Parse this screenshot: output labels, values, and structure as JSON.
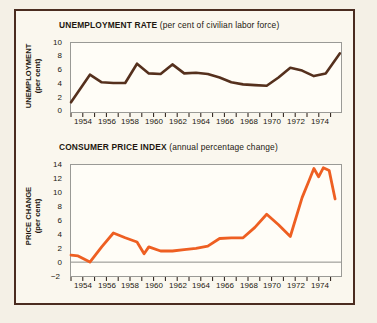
{
  "figure": {
    "background_color": "#f4f0e6",
    "border_color": "#4a2c20"
  },
  "charts": [
    {
      "id": "unemployment",
      "title_main": "UNEMPLOYMENT RATE",
      "title_sub": "(per cent of civilian labor force)",
      "ylabel_line1": "UNEMPLOYMENT",
      "ylabel_line2": "(per cent)",
      "line_color": "#55301d",
      "yticks": [
        "10",
        "8",
        "6",
        "4",
        "2",
        "0"
      ],
      "xticks": [
        "1954",
        "1956",
        "1958",
        "1960",
        "1962",
        "1964",
        "1966",
        "1968",
        "1970",
        "1972",
        "1974"
      ]
    },
    {
      "id": "cpi",
      "title_main": "CONSUMER PRICE INDEX",
      "title_sub": "(annual percentage change)",
      "ylabel_line1": "PRICE CHANGE",
      "ylabel_line2": "(per cent)",
      "line_color": "#ee5f22",
      "yticks": [
        "14",
        "12",
        "10",
        "8",
        "6",
        "4",
        "2",
        "0",
        "−2"
      ],
      "xticks": [
        "1954",
        "1956",
        "1958",
        "1960",
        "1962",
        "1964",
        "1966",
        "1968",
        "1970",
        "1972",
        "1974"
      ]
    }
  ],
  "chart_data": [
    {
      "type": "line",
      "id": "unemployment",
      "title": "UNEMPLOYMENT RATE (per cent of civilian labor force)",
      "xlabel": "",
      "ylabel": "UNEMPLOYMENT (per cent)",
      "ylim": [
        0,
        10
      ],
      "xlim": [
        1952.4,
        1975.3
      ],
      "yticks": [
        0,
        2,
        4,
        6,
        8,
        10
      ],
      "xticks": [
        1954,
        1956,
        1958,
        1960,
        1962,
        1964,
        1966,
        1968,
        1970,
        1972,
        1974
      ],
      "grid": false,
      "legend": "none",
      "line_color": "#55301d",
      "series": [
        {
          "name": "Unemployment rate",
          "x": [
            1952.4,
            1954.0,
            1955.0,
            1956.0,
            1957.0,
            1958.0,
            1959.0,
            1960.0,
            1961.0,
            1962.0,
            1963.0,
            1964.0,
            1965.0,
            1966.0,
            1967.0,
            1968.0,
            1969.0,
            1970.0,
            1971.0,
            1972.0,
            1973.0,
            1974.0,
            1975.2
          ],
          "values": [
            1.4,
            5.4,
            4.3,
            4.2,
            4.2,
            7.0,
            5.6,
            5.5,
            6.9,
            5.6,
            5.7,
            5.5,
            5.0,
            4.3,
            4.0,
            3.9,
            3.8,
            5.0,
            6.4,
            6.0,
            5.2,
            5.6,
            8.5
          ]
        }
      ]
    },
    {
      "type": "line",
      "id": "cpi",
      "title": "CONSUMER PRICE INDEX (annual percentage change)",
      "xlabel": "",
      "ylabel": "PRICE CHANGE (per cent)",
      "ylim": [
        -2,
        14
      ],
      "xlim": [
        1952.4,
        1975.3
      ],
      "yticks": [
        -2,
        0,
        2,
        4,
        6,
        8,
        10,
        12,
        14
      ],
      "xticks": [
        1954,
        1956,
        1958,
        1960,
        1962,
        1964,
        1966,
        1968,
        1970,
        1972,
        1974
      ],
      "grid": false,
      "legend": "none",
      "zero_line": 0,
      "line_color": "#ee5f22",
      "series": [
        {
          "name": "Consumer price index annual percentage change",
          "x": [
            1952.4,
            1953.0,
            1954.0,
            1955.0,
            1956.0,
            1957.0,
            1958.0,
            1958.6,
            1959.0,
            1960.0,
            1961.0,
            1962.0,
            1963.0,
            1964.0,
            1965.0,
            1966.0,
            1967.0,
            1968.0,
            1969.0,
            1970.0,
            1971.0,
            1972.0,
            1972.6,
            1973.0,
            1973.4,
            1973.8,
            1974.3,
            1974.8
          ],
          "values": [
            1.0,
            0.9,
            0.0,
            2.2,
            4.2,
            3.5,
            2.9,
            1.2,
            2.2,
            1.6,
            1.6,
            1.8,
            2.0,
            2.3,
            3.4,
            3.5,
            3.5,
            5.0,
            6.9,
            5.4,
            3.7,
            9.3,
            11.8,
            13.5,
            12.3,
            13.6,
            13.2,
            9.1
          ]
        }
      ]
    }
  ]
}
